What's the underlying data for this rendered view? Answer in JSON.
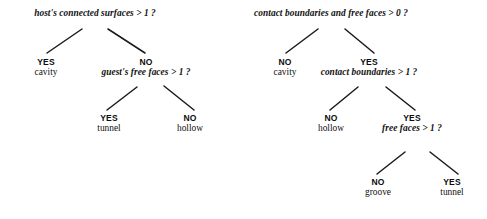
{
  "diagram": {
    "trees": [
      {
        "id": "host-tree",
        "root": {
          "question": "host's connected surfaces > 1 ?",
          "x": 95,
          "y": 8
        },
        "nodes": [
          {
            "id": "host-yes-cavity",
            "answer": "YES",
            "leaf": "cavity",
            "x": 46,
            "y": 58
          },
          {
            "id": "host-no-guest",
            "answer": "NO",
            "question": "guest's free faces > 1 ?",
            "x": 146,
            "y": 58
          },
          {
            "id": "guest-yes-tunnel",
            "answer": "YES",
            "leaf": "tunnel",
            "x": 109,
            "y": 114
          },
          {
            "id": "guest-no-hollow",
            "answer": "NO",
            "leaf": "hollow",
            "x": 190,
            "y": 114
          }
        ],
        "edges": [
          {
            "from": "root",
            "to": "host-yes-cavity",
            "x1": 82,
            "y1": 29,
            "x2": 47,
            "y2": 53
          },
          {
            "from": "root",
            "to": "host-no-guest",
            "x1": 108,
            "y1": 29,
            "x2": 145,
            "y2": 53
          },
          {
            "from": "host-no-guest",
            "to": "guest-yes-tunnel",
            "x1": 137,
            "y1": 87,
            "x2": 107,
            "y2": 110
          },
          {
            "from": "host-no-guest",
            "to": "guest-no-hollow",
            "x1": 164,
            "y1": 86,
            "x2": 194,
            "y2": 110
          }
        ]
      },
      {
        "id": "contact-tree",
        "root": {
          "question": "contact boundaries and free faces > 0 ?",
          "x": 331,
          "y": 8
        },
        "nodes": [
          {
            "id": "contact-no-cavity",
            "answer": "NO",
            "leaf": "cavity",
            "x": 285,
            "y": 58
          },
          {
            "id": "contact-yes-bounds",
            "answer": "YES",
            "question": "contact boundaries > 1 ?",
            "x": 369,
            "y": 58
          },
          {
            "id": "bounds-no-hollow",
            "answer": "NO",
            "leaf": "hollow",
            "x": 331,
            "y": 114
          },
          {
            "id": "bounds-yes-faces",
            "answer": "YES",
            "question": "free faces > 1 ?",
            "x": 412,
            "y": 114
          },
          {
            "id": "faces-no-groove",
            "answer": "NO",
            "leaf": "groove",
            "x": 378,
            "y": 178
          },
          {
            "id": "faces-yes-tunnel",
            "answer": "YES",
            "leaf": "tunnel",
            "x": 452,
            "y": 178
          }
        ],
        "edges": [
          {
            "from": "root",
            "to": "contact-no-cavity",
            "x1": 318,
            "y1": 29,
            "x2": 286,
            "y2": 53
          },
          {
            "from": "root",
            "to": "contact-yes-bounds",
            "x1": 345,
            "y1": 29,
            "x2": 374,
            "y2": 53
          },
          {
            "from": "contact-yes-bounds",
            "to": "bounds-no-hollow",
            "x1": 358,
            "y1": 87,
            "x2": 330,
            "y2": 110
          },
          {
            "from": "contact-yes-bounds",
            "to": "bounds-yes-faces",
            "x1": 386,
            "y1": 87,
            "x2": 415,
            "y2": 110
          },
          {
            "from": "bounds-yes-faces",
            "to": "faces-no-groove",
            "x1": 405,
            "y1": 152,
            "x2": 377,
            "y2": 174
          },
          {
            "from": "bounds-yes-faces",
            "to": "faces-yes-tunnel",
            "x1": 430,
            "y1": 152,
            "x2": 458,
            "y2": 174
          }
        ]
      }
    ],
    "style": {
      "line_color": "#1a1a1a",
      "text_color": "#111111",
      "background": "#ffffff"
    }
  }
}
